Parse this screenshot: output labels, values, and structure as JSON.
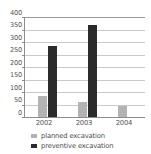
{
  "chart_data": {
    "type": "bar",
    "title": "",
    "subtitle": "",
    "xlabel": "",
    "ylabel": "",
    "categories": [
      "2002",
      "2003",
      "2004"
    ],
    "series": [
      {
        "name": "planned excavation",
        "color": "#b3b3b3",
        "values": [
          85,
          60,
          44
        ]
      },
      {
        "name": "preventive excavation",
        "color": "#2b2b2b",
        "values": [
          285,
          370,
          0
        ]
      }
    ],
    "ylim": [
      0,
      400
    ],
    "ytick_step": 50,
    "ytick_labels": [
      "400",
      "350",
      "300",
      "250",
      "200",
      "150",
      "100",
      "50",
      "0"
    ],
    "ytick_values": [
      400,
      350,
      300,
      250,
      200,
      150,
      100,
      50,
      0
    ],
    "grid": true,
    "grid_axis": "y",
    "legend_position": "bottom-left",
    "annotations": []
  },
  "legend": {
    "entries": [
      {
        "label": "planned excavation",
        "swatch": "legend-swatch-planned"
      },
      {
        "label": "preventive excavation",
        "swatch": "legend-swatch-preventive"
      }
    ]
  },
  "colors": {
    "planned": "#b3b3b3",
    "preventive": "#2b2b2b",
    "axis": "#8d8d8d",
    "grid": "#c9c9c9",
    "text": "#4d4d4d",
    "background": "#ffffff"
  }
}
